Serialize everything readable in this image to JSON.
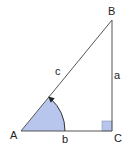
{
  "diagram": {
    "vertices": {
      "A": {
        "label": "A",
        "x": 21,
        "y": 131
      },
      "B": {
        "label": "B",
        "x": 112,
        "y": 20
      },
      "C": {
        "label": "C",
        "x": 112,
        "y": 131
      }
    },
    "sides": {
      "a": {
        "label": "a",
        "between": "B-C"
      },
      "b": {
        "label": "b",
        "between": "A-C"
      },
      "c": {
        "label": "c",
        "between": "A-B"
      }
    },
    "angle_A": {
      "fill": "#b8c6ee",
      "arrow": "counterclockwise"
    },
    "right_angle_C": {
      "fill": "#b8c6ee"
    },
    "colors": {
      "line": "#555555",
      "shade": "#b8c6ee",
      "text": "#222222"
    }
  }
}
